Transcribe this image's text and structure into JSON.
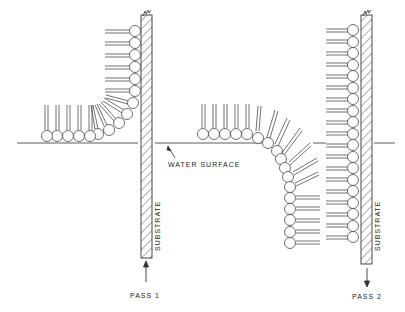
{
  "diagram": {
    "type": "Langmuir-Blodgett deposition schematic",
    "labels": {
      "water_surface": "WATER SURFACE",
      "substrate_1": "SUBSTRATE",
      "substrate_2": "SUBSTRATE",
      "pass_1": "PASS 1",
      "pass_2": "PASS 2"
    },
    "panels": [
      {
        "name": "pass-1",
        "substrate_motion": "up",
        "description": "monolayer transferred onto substrate withdrawn upward"
      },
      {
        "name": "pass-2",
        "substrate_motion": "down",
        "description": "second layer transferred as substrate dips down"
      }
    ],
    "colors": {
      "ink": "#222222",
      "background": "#ffffff"
    }
  }
}
